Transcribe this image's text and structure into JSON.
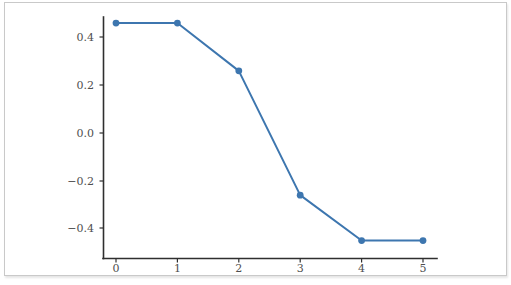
{
  "chart_data": {
    "type": "line",
    "title": "",
    "subtitle": "",
    "xlabel": "",
    "ylabel": "",
    "x": [
      0,
      1,
      2,
      3,
      4,
      5
    ],
    "values": [
      0.46,
      0.46,
      0.26,
      -0.26,
      -0.45,
      -0.45
    ],
    "series": [
      {
        "name": "",
        "values": [
          0.46,
          0.46,
          0.26,
          -0.26,
          -0.45,
          -0.45
        ],
        "color": "#3d76af",
        "marker": "circle",
        "linewidth": 2
      }
    ],
    "xlim": [
      -0.2,
      5.45
    ],
    "ylim": [
      -0.52,
      0.52
    ],
    "xticks": [
      0,
      1,
      2,
      3,
      4,
      5
    ],
    "xtick_labels": [
      "0",
      "1",
      "2",
      "3",
      "4",
      "5"
    ],
    "yticks": [
      0.4,
      0.2,
      0.0,
      -0.2,
      -0.4
    ],
    "ytick_labels": [
      "0.4",
      "0.2",
      "0.0",
      "−0.2",
      "−0.4"
    ],
    "grid": false,
    "legend": false,
    "legend_position": "none",
    "spines_visible": [
      "left",
      "bottom"
    ],
    "annotations": []
  },
  "style": {
    "line_color": "#3d76af",
    "marker_color": "#3d76af",
    "axis_color": "#2f2f2f",
    "tick_label_color": "#4f4f4f",
    "plot_background": "#ffffff",
    "frame_border_color": "#c9c9c9"
  },
  "ytick_labels": {
    "t0": "0.4",
    "t1": "0.2",
    "t2": "0.0",
    "t3": "−0.2",
    "t4": "−0.4"
  },
  "xtick_labels": {
    "t0": "0",
    "t1": "1",
    "t2": "2",
    "t3": "3",
    "t4": "4",
    "t5": "5"
  }
}
